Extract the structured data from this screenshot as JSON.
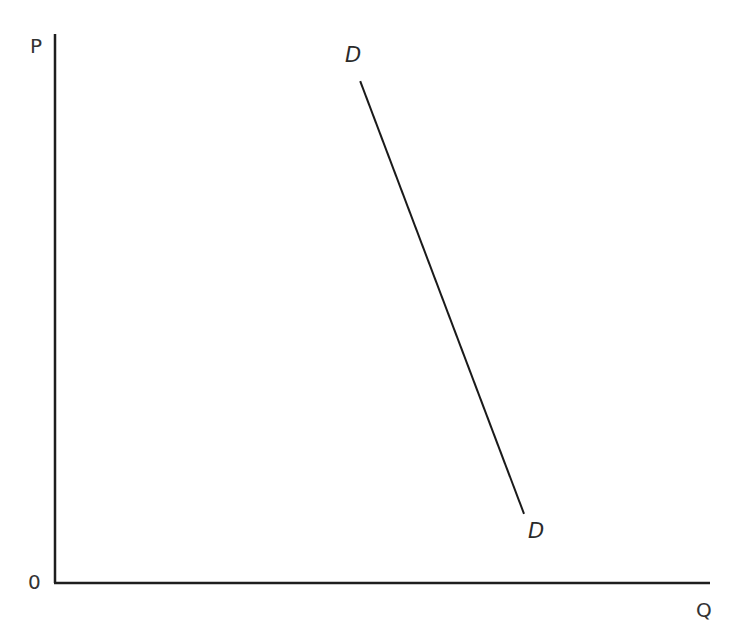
{
  "chart_data": {
    "type": "line",
    "title": "",
    "xlabel": "Q",
    "ylabel": "P",
    "origin_label": "0",
    "grid": false,
    "legend": null,
    "xlim": [
      0,
      100
    ],
    "ylim": [
      0,
      100
    ],
    "series": [
      {
        "name": "D",
        "label_start": "D",
        "label_end": "D",
        "description": "Steep, downward-sloping demand curve (relatively inelastic)",
        "points": [
          {
            "x": 46.6,
            "y": 91.4
          },
          {
            "x": 71.6,
            "y": 12.6
          }
        ],
        "color": "#1a1a1a"
      }
    ]
  },
  "axes": {
    "y_label": "P",
    "x_label": "Q",
    "origin": "0"
  },
  "curve": {
    "label_top": "D",
    "label_bottom": "D"
  },
  "colors": {
    "axis": "#1e1e1e",
    "curve": "#1a1a1a",
    "background": "#ffffff"
  }
}
